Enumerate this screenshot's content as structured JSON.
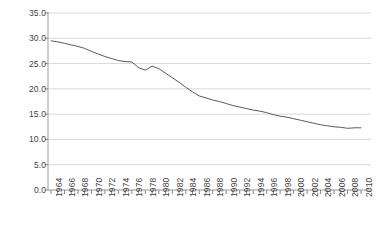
{
  "chart_data": {
    "type": "line",
    "title": "",
    "subtitle": "",
    "xlabel": "",
    "ylabel": "",
    "xlim": [
      1964,
      2010
    ],
    "ylim": [
      0.0,
      35.0
    ],
    "y_ticks": [
      "0.0",
      "5.0",
      "10.0",
      "15.0",
      "20.0",
      "25.0",
      "30.0",
      "35.0"
    ],
    "y_tick_values": [
      0.0,
      5.0,
      10.0,
      15.0,
      20.0,
      25.0,
      30.0,
      35.0
    ],
    "x_tick_labels": [
      "1964",
      "1966",
      "1968",
      "1970",
      "1972",
      "1974",
      "1976",
      "1978",
      "1980",
      "1982",
      "1984",
      "1986",
      "1988",
      "1990",
      "1992",
      "1994",
      "1996",
      "1998",
      "2000",
      "2002",
      "2004",
      "2006",
      "2008",
      "2010"
    ],
    "x_tick_label_rotation": -90,
    "x_minor_tick_interval": 1,
    "grid": "horizontal",
    "legend": "none",
    "series": [
      {
        "name": "series-1",
        "color": "#5a5a5a",
        "x": [
          1964,
          1965,
          1966,
          1967,
          1968,
          1969,
          1970,
          1971,
          1972,
          1973,
          1974,
          1975,
          1976,
          1977,
          1978,
          1979,
          1980,
          1981,
          1982,
          1983,
          1984,
          1985,
          1986,
          1987,
          1988,
          1989,
          1990,
          1991,
          1992,
          1993,
          1994,
          1995,
          1996,
          1997,
          1998,
          1999,
          2000,
          2001,
          2002,
          2003,
          2004,
          2005,
          2006,
          2007,
          2008,
          2009,
          2010
        ],
        "values": [
          29.5,
          29.3,
          29.0,
          28.7,
          28.4,
          28.0,
          27.4,
          26.9,
          26.4,
          26.0,
          25.6,
          25.4,
          25.3,
          24.2,
          23.7,
          24.5,
          24.0,
          23.1,
          22.2,
          21.3,
          20.3,
          19.4,
          18.6,
          18.2,
          17.8,
          17.5,
          17.1,
          16.7,
          16.4,
          16.1,
          15.8,
          15.6,
          15.3,
          14.9,
          14.6,
          14.4,
          14.1,
          13.8,
          13.5,
          13.2,
          12.9,
          12.7,
          12.5,
          12.4,
          12.2,
          12.3,
          12.3
        ]
      }
    ],
    "styling": {
      "background": "#ffffff",
      "gridline_color": "#d9d9d9",
      "axis_color": "#868686",
      "tick_label_color": "#3f3f3f",
      "line_color": "#5a5a5a",
      "line_width": 1
    }
  }
}
